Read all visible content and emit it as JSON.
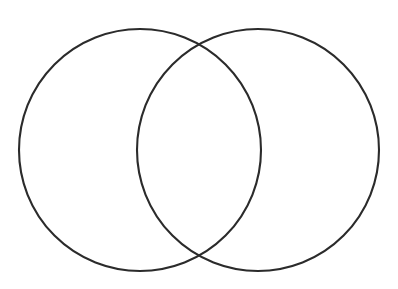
{
  "figure": {
    "kind": "venn-diagram",
    "title": "",
    "caption": "",
    "background_color": "#ffffff",
    "stroke_color": "#2b2b2b",
    "stroke_width": 2,
    "fill": "none",
    "width": 398,
    "height": 289,
    "set_count": 2,
    "labels_present": false,
    "region_labels": {
      "left_only": "",
      "overlap": "",
      "right_only": ""
    }
  },
  "chart_data": {
    "type": "venn",
    "title": "",
    "xlabel": "",
    "ylabel": "",
    "legend": [],
    "grid": false,
    "sets": [
      {
        "name": "left-circle",
        "label": "",
        "cx": 140,
        "cy": 150,
        "r": 121,
        "stroke": "#2b2b2b",
        "fill": "none"
      },
      {
        "name": "right-circle",
        "label": "",
        "cx": 258,
        "cy": 150,
        "r": 121,
        "stroke": "#2b2b2b",
        "fill": "none"
      }
    ],
    "intersection_points": [
      {
        "x": 199,
        "y": 44
      },
      {
        "x": 199,
        "y": 256
      }
    ],
    "bounds": {
      "left": 19,
      "right": 379,
      "top": 29,
      "bottom": 271
    }
  }
}
